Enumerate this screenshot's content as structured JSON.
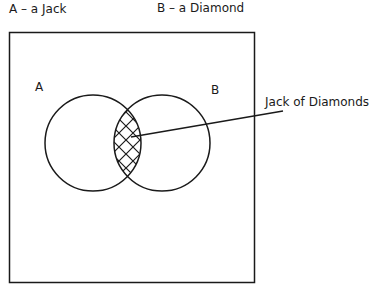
{
  "legend": {
    "a_definition": "A – a Jack",
    "b_definition": "B – a Diamond"
  },
  "diagram": {
    "set_a_label": "A",
    "set_b_label": "B",
    "intersection_label": "Jack of Diamonds"
  },
  "colors": {
    "stroke": "#1a1a1a",
    "background": "#ffffff"
  }
}
